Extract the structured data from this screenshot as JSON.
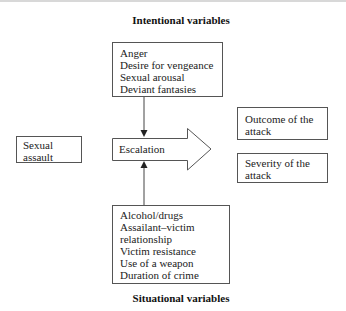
{
  "diagram": {
    "top_title": "Intentional variables",
    "bottom_title": "Situational variables",
    "intentional_box": {
      "items": [
        "Anger",
        "Desire for vengeance",
        "Sexual arousal",
        "Deviant fantasies"
      ]
    },
    "situational_box": {
      "items": [
        "Alcohol/drugs",
        "Assailant–victim",
        "relationship",
        "Victim resistance",
        "Use of a weapon",
        "Duration of crime"
      ]
    },
    "input_box": {
      "lines": [
        "Sexual",
        "assault"
      ]
    },
    "process_arrow": {
      "label": "Escalation"
    },
    "output_boxes": [
      {
        "lines": [
          "Outcome of the",
          "attack"
        ]
      },
      {
        "lines": [
          "Severity of the",
          "attack"
        ]
      }
    ],
    "colors": {
      "stroke": "#555555",
      "text": "#222222",
      "background": "#ffffff"
    }
  }
}
